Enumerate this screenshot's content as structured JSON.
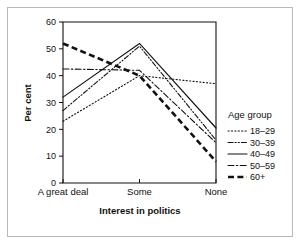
{
  "figure": {
    "name": "line-chart-interest-in-politics"
  },
  "chart_data": {
    "type": "line",
    "title": "",
    "xlabel": "Interest in politics",
    "ylabel": "Per cent",
    "categories": [
      "A great deal",
      "Some",
      "None"
    ],
    "ylim": [
      0,
      60
    ],
    "yticks": [
      0,
      10,
      20,
      30,
      40,
      50,
      60
    ],
    "ytick_labels": [
      "0",
      "10",
      "20",
      "30",
      "40",
      "50",
      "60"
    ],
    "grid": false,
    "legend_position": "right",
    "legend_title": "Age group",
    "series": [
      {
        "name": "18–29",
        "values": [
          23,
          40,
          37
        ],
        "style": "dotted",
        "width": 1.1
      },
      {
        "name": "30–39",
        "values": [
          27,
          51,
          16
        ],
        "style": "dash-dot-dot",
        "width": 1.1
      },
      {
        "name": "40–49",
        "values": [
          32,
          52,
          20.5
        ],
        "style": "solid",
        "width": 1.2
      },
      {
        "name": "50–59",
        "values": [
          42.5,
          42,
          15
        ],
        "style": "dash-dot",
        "width": 1.1
      },
      {
        "name": "60+",
        "values": [
          52,
          40,
          8
        ],
        "style": "thick-dashed",
        "width": 2.6
      }
    ]
  }
}
